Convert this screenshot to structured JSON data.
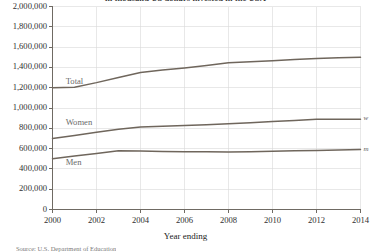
{
  "chart_data": {
    "type": "line",
    "title": "in thousand US dollars invested in the USA",
    "xlabel": "Year ending",
    "ylabel": "",
    "x": [
      2000,
      2001,
      2002,
      2003,
      2004,
      2005,
      2006,
      2007,
      2008,
      2009,
      2010,
      2011,
      2012,
      2013,
      2014
    ],
    "xlim": [
      2000,
      2014
    ],
    "ylim": [
      0,
      2000000
    ],
    "grid": true,
    "legend_position": "inline",
    "series": [
      {
        "name": "Total",
        "label": "Total",
        "edge_label": "",
        "color": "#6f665c",
        "values": [
          1200000,
          1205000,
          1250000,
          1300000,
          1350000,
          1375000,
          1395000,
          1418000,
          1445000,
          1455000,
          1465000,
          1478000,
          1487000,
          1494000,
          1500000
        ]
      },
      {
        "name": "Women",
        "label": "Women",
        "edge_label": "w",
        "color": "#6f665c",
        "values": [
          700000,
          730000,
          760000,
          790000,
          812000,
          820000,
          827000,
          835000,
          845000,
          855000,
          866000,
          878000,
          888000,
          889000,
          890000
        ]
      },
      {
        "name": "Men",
        "label": "Men",
        "edge_label": "m",
        "color": "#6f665c",
        "values": [
          500000,
          527000,
          552000,
          578000,
          576000,
          572000,
          569000,
          568000,
          567000,
          570000,
          574000,
          578000,
          582000,
          586000,
          590000
        ]
      }
    ],
    "y_ticks": [
      {
        "value": 0,
        "label": "0"
      },
      {
        "value": 200000,
        "label": "200,000"
      },
      {
        "value": 400000,
        "label": "400,000"
      },
      {
        "value": 600000,
        "label": "600,000"
      },
      {
        "value": 800000,
        "label": "800,000"
      },
      {
        "value": 1000000,
        "label": "1,000,000"
      },
      {
        "value": 1200000,
        "label": "1,200,000"
      },
      {
        "value": 1400000,
        "label": "1,400,000"
      },
      {
        "value": 1600000,
        "label": "1,600,000"
      },
      {
        "value": 1800000,
        "label": "1,800,000"
      },
      {
        "value": 2000000,
        "label": "2,000,000"
      }
    ],
    "x_ticks": [
      {
        "value": 2000,
        "label": "2000"
      },
      {
        "value": 2002,
        "label": "2002"
      },
      {
        "value": 2004,
        "label": "2004"
      },
      {
        "value": 2006,
        "label": "2006"
      },
      {
        "value": 2008,
        "label": "2008"
      },
      {
        "value": 2010,
        "label": "2010"
      },
      {
        "value": 2012,
        "label": "2012"
      },
      {
        "value": 2014,
        "label": "2014"
      }
    ],
    "inline_labels": [
      {
        "text": "Total",
        "x": 2000.6,
        "y": 1255000
      },
      {
        "text": "Women",
        "x": 2000.6,
        "y": 855000
      },
      {
        "text": "Men",
        "x": 2000.6,
        "y": 455000
      }
    ],
    "source_note": "Source: U.S. Department of Education"
  }
}
